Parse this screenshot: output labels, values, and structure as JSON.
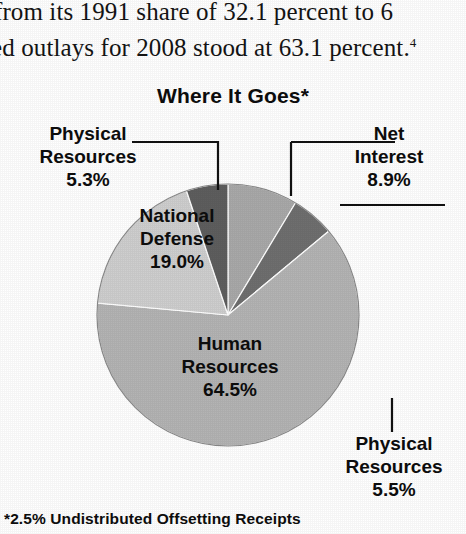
{
  "excerpt": {
    "line1": "from its 1991 share of 32.1 percent to 6",
    "line2": "ted outlays for 2008 stood at 63.1 percent.",
    "footnote_marker": "4"
  },
  "chart_title": "Where It Goes*",
  "footnote": "*2.5% Undistributed Offsetting Receipts",
  "labels": {
    "physical_left": {
      "line1": "Physical",
      "line2": "Resources",
      "value": "5.3%"
    },
    "net_interest": {
      "line1": "Net",
      "line2": "Interest",
      "value": "8.9%"
    },
    "national_defense": {
      "line1": "National",
      "line2": "Defense",
      "value": "19.0%"
    },
    "human_resources": {
      "line1": "Human",
      "line2": "Resources",
      "value": "64.5%"
    },
    "physical_right": {
      "line1": "Physical",
      "line2": "Resources",
      "value": "5.5%"
    }
  },
  "chart_data": {
    "type": "pie",
    "title": "Where It Goes*",
    "note": "*2.5% Undistributed Offsetting Receipts",
    "categories": [
      "Net Interest",
      "Physical Resources",
      "Human Resources",
      "National Defense",
      "Physical Resources"
    ],
    "labels": [
      "Net Interest 8.9%",
      "Physical Resources 5.5%",
      "Human Resources 64.5%",
      "National Defense 19.0%",
      "Physical Resources 5.3%"
    ],
    "values": [
      8.9,
      5.5,
      64.5,
      19.0,
      5.3
    ],
    "colors": [
      "#a9a9a9",
      "#6f6f6f",
      "#b4b4b4",
      "#cfcfcf",
      "#5e5e5e"
    ],
    "start_angle_deg": 0,
    "direction": "clockwise",
    "legend": "none",
    "grid": false,
    "xlabel": "",
    "ylabel": ""
  },
  "geometry": {
    "cx": 228,
    "cy": 315,
    "r": 131
  }
}
